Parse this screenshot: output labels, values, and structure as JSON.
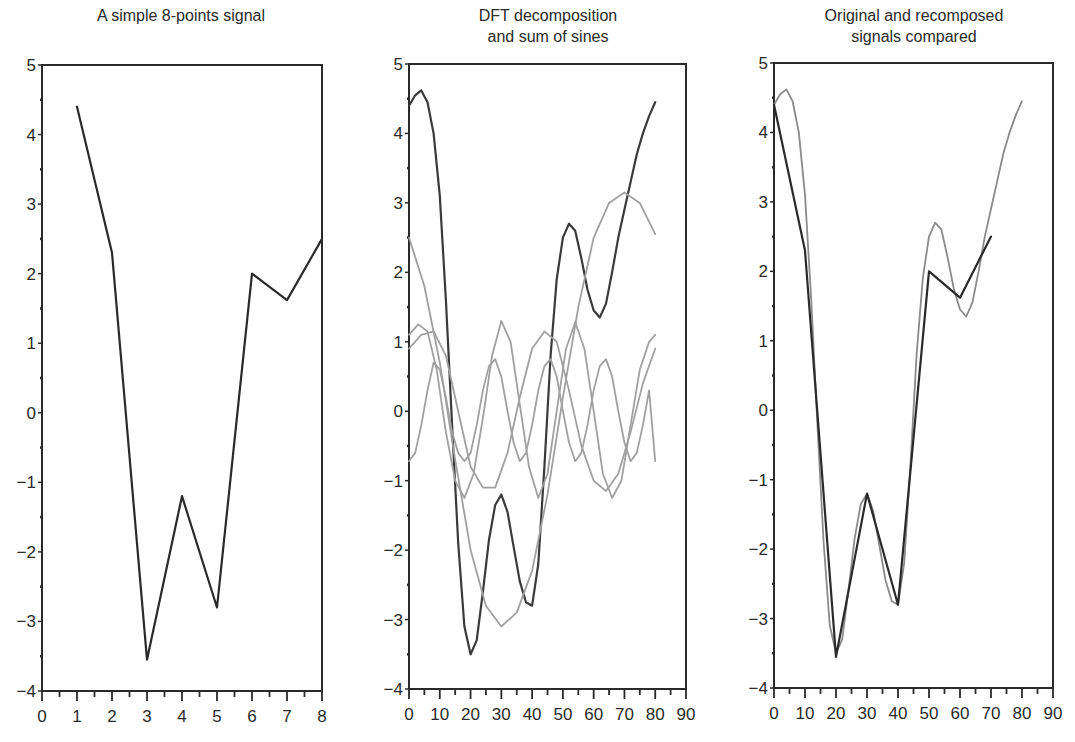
{
  "figure": {
    "panels": [
      {
        "title": "A simple 8-points signal"
      },
      {
        "title": "DFT decomposition\nand sum of sines"
      },
      {
        "title": "Original and recomposed\nsignals compared"
      }
    ]
  },
  "chart_data": [
    {
      "type": "line",
      "title": "A simple 8-points signal",
      "xlabel": "",
      "ylabel": "",
      "xlim": [
        0,
        8
      ],
      "ylim": [
        -4,
        5
      ],
      "xticks": [
        0,
        1,
        2,
        3,
        4,
        5,
        6,
        7,
        8
      ],
      "yticks": [
        -4,
        -3,
        -2,
        -1,
        0,
        1,
        2,
        3,
        4,
        5
      ],
      "grid": false,
      "series": [
        {
          "name": "signal",
          "color": "#2a2a2a",
          "x": [
            1,
            2,
            3,
            4,
            5,
            6,
            7,
            8
          ],
          "y": [
            4.4,
            2.3,
            -3.55,
            -1.2,
            -2.8,
            2.0,
            1.62,
            2.5
          ]
        }
      ]
    },
    {
      "type": "line",
      "title": "DFT decomposition and sum of sines",
      "xlabel": "",
      "ylabel": "",
      "xlim": [
        0,
        90
      ],
      "ylim": [
        -4,
        5
      ],
      "xticks": [
        0,
        10,
        20,
        30,
        40,
        50,
        60,
        70,
        80,
        90
      ],
      "yticks": [
        -4,
        -3,
        -2,
        -1,
        0,
        1,
        2,
        3,
        4,
        5
      ],
      "grid": false,
      "series": [
        {
          "name": "sum of sines",
          "color": "#3a3a3a",
          "x": [
            0,
            2,
            4,
            6,
            8,
            10,
            12,
            14,
            16,
            18,
            20,
            22,
            24,
            26,
            28,
            30,
            32,
            34,
            36,
            38,
            40,
            42,
            44,
            46,
            48,
            50,
            52,
            54,
            56,
            58,
            60,
            62,
            64,
            66,
            68,
            70,
            72,
            74,
            76,
            78,
            80
          ],
          "y": [
            4.4,
            4.55,
            4.62,
            4.45,
            4.0,
            3.1,
            1.6,
            -0.2,
            -1.9,
            -3.1,
            -3.5,
            -3.3,
            -2.6,
            -1.85,
            -1.35,
            -1.2,
            -1.45,
            -1.95,
            -2.45,
            -2.75,
            -2.8,
            -2.2,
            -0.8,
            0.8,
            1.9,
            2.5,
            2.7,
            2.6,
            2.2,
            1.75,
            1.45,
            1.35,
            1.55,
            2.0,
            2.5,
            2.9,
            3.3,
            3.7,
            4.0,
            4.25,
            4.45
          ]
        },
        {
          "name": "component 1 (slow)",
          "color": "#a0a0a0",
          "x": [
            0,
            5,
            10,
            15,
            20,
            25,
            30,
            35,
            40,
            45,
            50,
            55,
            60,
            65,
            70,
            75,
            80
          ],
          "y": [
            2.5,
            1.8,
            0.7,
            -0.7,
            -2.0,
            -2.8,
            -3.1,
            -2.9,
            -2.3,
            -1.2,
            0.2,
            1.5,
            2.5,
            3.0,
            3.15,
            3.0,
            2.55
          ]
        },
        {
          "name": "component 2",
          "color": "#a0a0a0",
          "x": [
            0,
            4,
            8,
            12,
            16,
            20,
            24,
            28,
            32,
            36,
            40,
            44,
            48,
            52,
            56,
            60,
            64,
            68,
            72,
            76,
            80
          ],
          "y": [
            0.9,
            1.1,
            1.15,
            0.8,
            0.0,
            -0.8,
            -1.1,
            -1.1,
            -0.6,
            0.2,
            0.9,
            1.15,
            1.0,
            0.3,
            -0.5,
            -1.0,
            -1.15,
            -0.9,
            -0.3,
            0.4,
            0.9
          ]
        },
        {
          "name": "component 3",
          "color": "#a0a0a0",
          "x": [
            0,
            3,
            6,
            9,
            12,
            15,
            18,
            21,
            24,
            27,
            30,
            33,
            36,
            39,
            42,
            45,
            48,
            51,
            54,
            57,
            60,
            63,
            66,
            69,
            72,
            75,
            78,
            80
          ],
          "y": [
            1.1,
            1.25,
            1.15,
            0.6,
            -0.3,
            -1.0,
            -1.25,
            -0.9,
            -0.1,
            0.8,
            1.3,
            1.0,
            0.1,
            -0.8,
            -1.25,
            -0.9,
            0.0,
            0.9,
            1.28,
            0.9,
            0.0,
            -0.9,
            -1.25,
            -1.0,
            -0.2,
            0.6,
            1.0,
            1.1
          ]
        },
        {
          "name": "component 4 (fast)",
          "color": "#a0a0a0",
          "x": [
            0,
            2,
            4,
            6,
            8,
            10,
            12,
            14,
            16,
            18,
            20,
            22,
            24,
            26,
            28,
            30,
            32,
            34,
            36,
            38,
            40,
            42,
            44,
            46,
            48,
            50,
            52,
            54,
            56,
            58,
            60,
            62,
            64,
            66,
            68,
            70,
            72,
            74,
            76,
            78,
            80
          ],
          "y": [
            -0.72,
            -0.6,
            -0.2,
            0.3,
            0.7,
            0.6,
            0.2,
            -0.3,
            -0.6,
            -0.72,
            -0.6,
            -0.2,
            0.3,
            0.65,
            0.75,
            0.5,
            0.0,
            -0.45,
            -0.72,
            -0.6,
            -0.2,
            0.3,
            0.65,
            0.75,
            0.5,
            0.0,
            -0.45,
            -0.72,
            -0.6,
            -0.2,
            0.3,
            0.65,
            0.75,
            0.5,
            0.0,
            -0.45,
            -0.72,
            -0.6,
            -0.2,
            0.3,
            -0.72
          ]
        }
      ]
    },
    {
      "type": "line",
      "title": "Original and recomposed signals compared",
      "xlabel": "",
      "ylabel": "",
      "xlim": [
        0,
        90
      ],
      "ylim": [
        -4,
        5
      ],
      "xticks": [
        0,
        10,
        20,
        30,
        40,
        50,
        60,
        70,
        80,
        90
      ],
      "yticks": [
        -4,
        -3,
        -2,
        -1,
        0,
        1,
        2,
        3,
        4,
        5
      ],
      "grid": false,
      "series": [
        {
          "name": "recomposed",
          "color": "#8a8a8a",
          "x": [
            0,
            2,
            4,
            6,
            8,
            10,
            12,
            14,
            16,
            18,
            20,
            22,
            24,
            26,
            28,
            30,
            32,
            34,
            36,
            38,
            40,
            42,
            44,
            46,
            48,
            50,
            52,
            54,
            56,
            58,
            60,
            62,
            64,
            66,
            68,
            70,
            72,
            74,
            76,
            78,
            80
          ],
          "y": [
            4.4,
            4.55,
            4.62,
            4.45,
            4.0,
            3.1,
            1.6,
            -0.2,
            -1.9,
            -3.1,
            -3.5,
            -3.3,
            -2.6,
            -1.85,
            -1.35,
            -1.2,
            -1.45,
            -1.95,
            -2.45,
            -2.75,
            -2.8,
            -2.2,
            -0.8,
            0.8,
            1.9,
            2.5,
            2.7,
            2.6,
            2.2,
            1.75,
            1.45,
            1.35,
            1.55,
            2.0,
            2.5,
            2.9,
            3.3,
            3.7,
            4.0,
            4.25,
            4.45
          ]
        },
        {
          "name": "original",
          "color": "#2a2a2a",
          "x": [
            0,
            10,
            20,
            30,
            40,
            50,
            60,
            70
          ],
          "y": [
            4.4,
            2.3,
            -3.55,
            -1.2,
            -2.8,
            2.0,
            1.62,
            2.5
          ]
        }
      ]
    }
  ]
}
